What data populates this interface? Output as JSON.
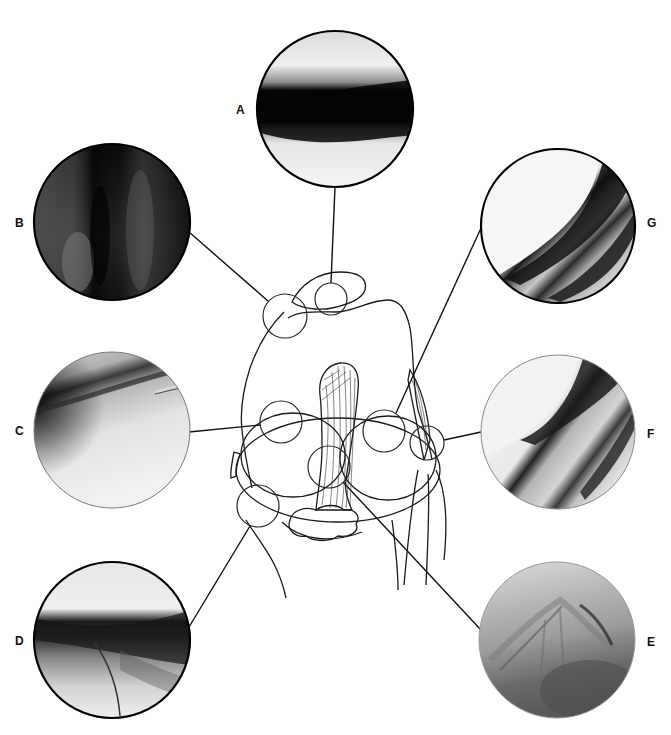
{
  "figure": {
    "type": "arthroscopic-knee-views",
    "background": "#ffffff",
    "line_color": "#111111"
  },
  "views": [
    {
      "id": "A",
      "label": "A",
      "cx": 335,
      "cy": 109,
      "r": 78,
      "label_x": 236,
      "label_y": 104,
      "tone": "dark-band"
    },
    {
      "id": "B",
      "label": "B",
      "cx": 112,
      "cy": 222,
      "r": 78,
      "label_x": 15,
      "label_y": 217,
      "tone": "dark"
    },
    {
      "id": "G",
      "label": "G",
      "cx": 558,
      "cy": 226,
      "r": 77,
      "label_x": 647,
      "label_y": 217,
      "tone": "light-diagonal"
    },
    {
      "id": "C",
      "label": "C",
      "cx": 112,
      "cy": 430,
      "r": 78,
      "label_x": 15,
      "label_y": 425,
      "tone": "light"
    },
    {
      "id": "F",
      "label": "F",
      "cx": 558,
      "cy": 432,
      "r": 77,
      "label_x": 647,
      "label_y": 428,
      "tone": "light-diagonal"
    },
    {
      "id": "D",
      "label": "D",
      "cx": 112,
      "cy": 640,
      "r": 78,
      "label_x": 15,
      "label_y": 635,
      "tone": "mid-band"
    },
    {
      "id": "E",
      "label": "E",
      "cx": 557,
      "cy": 640,
      "r": 78,
      "label_x": 647,
      "label_y": 636,
      "tone": "gray-textured"
    }
  ],
  "labels": {
    "A": "A",
    "B": "B",
    "C": "C",
    "D": "D",
    "E": "E",
    "F": "F",
    "G": "G"
  },
  "knee_diagram": {
    "description": "Line drawing of flexed knee joint with femoral condyles, patella, cruciate ligament and fat pad, with viewing circles marking arthroscopic portal views",
    "view_rings": [
      {
        "for": "A",
        "cx": 331,
        "cy": 299,
        "r": 16
      },
      {
        "for": "B",
        "cx": 285,
        "cy": 316,
        "r": 22
      },
      {
        "for": "C",
        "cx": 281,
        "cy": 422,
        "r": 21
      },
      {
        "for": "G",
        "cx": 384,
        "cy": 431,
        "r": 21
      },
      {
        "for": "E",
        "cx": 329,
        "cy": 467,
        "r": 21
      },
      {
        "for": "F",
        "cx": 427,
        "cy": 443,
        "r": 17
      },
      {
        "for": "D",
        "cx": 258,
        "cy": 506,
        "r": 21
      }
    ]
  }
}
